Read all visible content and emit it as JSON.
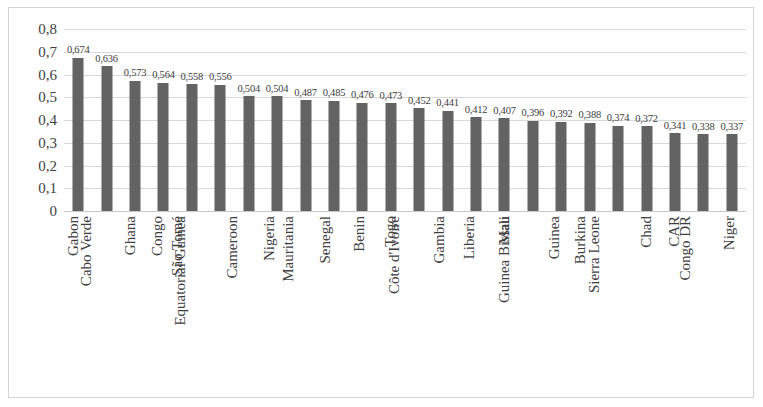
{
  "chart_data": {
    "type": "bar",
    "title": "",
    "subtitle": "",
    "xlabel": "",
    "ylabel": "",
    "ylim": [
      0,
      0.8
    ],
    "ytick_labels": [
      "0,8",
      "0,7",
      "0,6",
      "0,5",
      "0,4",
      "0,3",
      "0,2",
      "0,1",
      "0"
    ],
    "ytick_values": [
      0.8,
      0.7,
      0.6,
      0.5,
      0.4,
      0.3,
      0.2,
      0.1,
      0
    ],
    "grid": true,
    "legend": null,
    "legend_position": "none",
    "decimal_separator": ",",
    "bar_color": "#636363",
    "gridline_color": "#d9d9d9",
    "categories": [
      "Gabon",
      "Cabo Verde",
      "Ghana",
      "Congo",
      "São Tomé",
      "Equatorial Guinea",
      "Cameroon",
      "Nigeria",
      "Mauritania",
      "Senegal",
      "Benin",
      "Togo",
      "Côte d'Ivoire",
      "Gambia",
      "Liberia",
      "Mali",
      "Guinea Bissau",
      "Guinea",
      "Burkina",
      "Sierra Leone",
      "Chad",
      "CAR",
      "Congo DR",
      "Niger"
    ],
    "values": [
      0.674,
      0.636,
      0.573,
      0.564,
      0.558,
      0.556,
      0.504,
      0.504,
      0.487,
      0.485,
      0.476,
      0.473,
      0.452,
      0.441,
      0.412,
      0.407,
      0.396,
      0.392,
      0.388,
      0.374,
      0.372,
      0.341,
      0.338,
      0.337
    ],
    "value_labels": [
      "0,674",
      "0,636",
      "0,573",
      "0,564",
      "0,558",
      "0,556",
      "0,504",
      "0,504",
      "0,487",
      "0,485",
      "0,476",
      "0,473",
      "0,452",
      "0,441",
      "0,412",
      "0,407",
      "0,396",
      "0,392",
      "0,388",
      "0,374",
      "0,372",
      "0,341",
      "0,338",
      "0,337"
    ]
  }
}
